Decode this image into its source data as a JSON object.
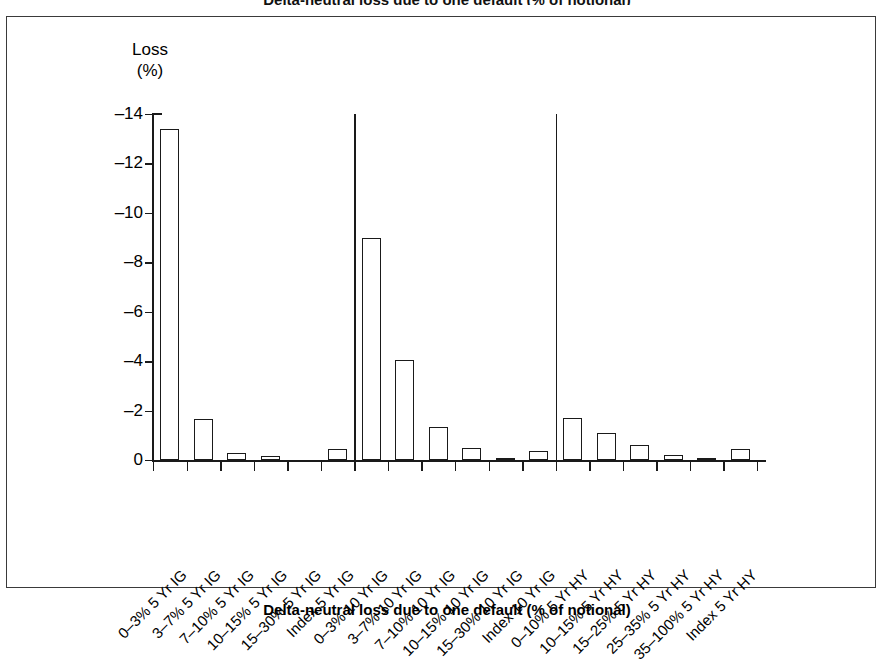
{
  "figure": {
    "clipped_title": "Delta-neutral loss due to one default (% of notional)",
    "caption": "Delta-neutral loss due to one default (% of notional)",
    "axis_title_line1": "Loss",
    "axis_title_line2": "(%)",
    "frame_color": "#3a3a3a",
    "bar_edge_color": "#1a1a1a",
    "bar_fill_color": "#ffffff",
    "background_color": "#ffffff"
  },
  "chart_data": {
    "type": "bar",
    "title": "Delta-neutral loss due to one default (% of notional)",
    "xlabel": "",
    "ylabel": "Loss (%)",
    "ylim": [
      0,
      -14
    ],
    "yticks": [
      0,
      -2,
      -4,
      -6,
      -8,
      -10,
      -12,
      -14
    ],
    "ytick_labels": [
      "0",
      "–2",
      "–4",
      "–6",
      "–8",
      "–10",
      "–12",
      "–14"
    ],
    "grid": false,
    "legend": "none",
    "y_axis_direction": "inverted-negative-up",
    "categories": [
      "0–3% 5 Yr IG",
      "3–7% 5 Yr IG",
      "7–10% 5 Yr IG",
      "10–15% 5 Yr IG",
      "15–30% 5 Yr IG",
      "Index 5 Yr IG",
      "0–3% 10 Yr IG",
      "3–7% 10 Yr IG",
      "7–10% 10 Yr IG",
      "10–15% 10 Yr IG",
      "15–30% 10 Yr IG",
      "Index 10 Yr IG",
      "0–10% 5 Yr HY",
      "10–15% 5 Yr HY",
      "15–25% 5 Yr HY",
      "25–35% 5 Yr HY",
      "35–100% 5 Yr HY",
      "Index 5 Yr HY"
    ],
    "values": [
      -13.4,
      -1.65,
      -0.3,
      -0.15,
      -0.02,
      -0.45,
      -9.0,
      -4.05,
      -1.35,
      -0.5,
      -0.1,
      -0.35,
      -1.7,
      -1.1,
      -0.6,
      -0.2,
      -0.1,
      -0.45
    ],
    "groups": [
      {
        "name": "5 Yr IG",
        "start_index": 0,
        "end_index": 5
      },
      {
        "name": "10 Yr IG",
        "start_index": 6,
        "end_index": 11
      },
      {
        "name": "5 Yr HY",
        "start_index": 12,
        "end_index": 17
      }
    ],
    "group_separator_indices": [
      6,
      12
    ]
  }
}
